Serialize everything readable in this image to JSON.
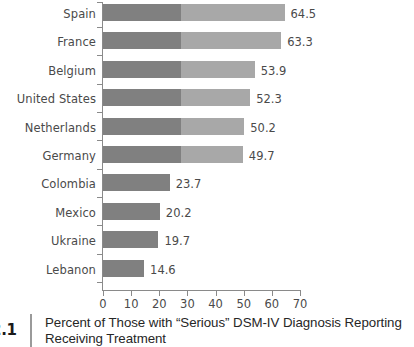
{
  "chart_data": {
    "type": "bar",
    "orientation": "horizontal",
    "title": "Percent of Those with “Serious” DSM-IV Diagnosis Reporting Receiving Treatment",
    "xlabel": "",
    "ylabel": "",
    "xlim": [
      0,
      70
    ],
    "xticks": [
      "0",
      "10",
      "20",
      "30",
      "40",
      "50",
      "60",
      "70"
    ],
    "grid": false,
    "legend": false,
    "bar_color": "#808080",
    "categories": [
      "Spain",
      "France",
      "Belgium",
      "United States",
      "Netherlands",
      "Germany",
      "Colombia",
      "Mexico",
      "Ukraine",
      "Lebanon"
    ],
    "values": [
      64.5,
      63.3,
      53.9,
      52.3,
      50.2,
      49.7,
      23.7,
      20.2,
      19.7,
      14.6
    ],
    "value_labels": [
      "64.5",
      "63.3",
      "53.9",
      "52.3",
      "50.2",
      "49.7",
      "23.7",
      "20.2",
      "19.7",
      "14.6"
    ]
  },
  "caption": {
    "figure_number": "2.1",
    "line1": "Percent of Those with “Serious” DSM-IV Diagnosis Reporting",
    "line2": "Receiving Treatment"
  }
}
